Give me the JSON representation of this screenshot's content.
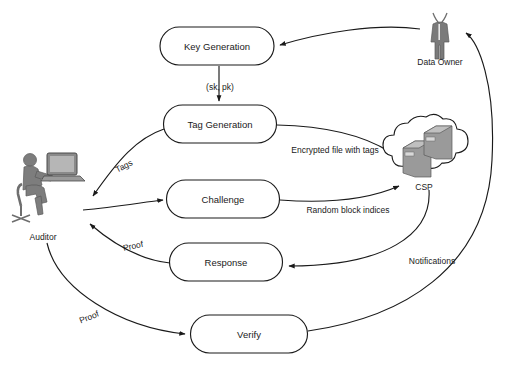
{
  "diagram": {
    "background_color": "#ffffff",
    "stroke_color": "#1a1a1a",
    "actor_fill": "#8c8c8c"
  },
  "nodes": [
    {
      "id": "key-generation",
      "label": "Key Generation",
      "x": 217,
      "y": 46,
      "w": 114,
      "h": 38
    },
    {
      "id": "tag-generation",
      "label": "Tag Generation",
      "x": 220,
      "y": 124,
      "w": 113,
      "h": 38
    },
    {
      "id": "challenge",
      "label": "Challenge",
      "x": 223,
      "y": 199,
      "w": 113,
      "h": 38
    },
    {
      "id": "response",
      "label": "Response",
      "x": 226,
      "y": 262,
      "w": 113,
      "h": 38
    },
    {
      "id": "verify",
      "label": "Verify",
      "x": 249,
      "y": 334,
      "w": 117,
      "h": 38
    }
  ],
  "actors": [
    {
      "id": "data-owner",
      "label": "Data Owner",
      "x": 440,
      "y": 33,
      "label_y": 62
    },
    {
      "id": "auditor",
      "label": "Auditor",
      "x": 43,
      "y": 185,
      "label_y": 237
    },
    {
      "id": "csp",
      "label": "CSP",
      "x": 424,
      "y": 163,
      "label_y": 187
    }
  ],
  "edges": [
    {
      "id": "owner-to-keygen",
      "label": "",
      "from": "data-owner",
      "to": "key-generation"
    },
    {
      "id": "keygen-to-taggen",
      "label": "(sk, pk)",
      "from": "key-generation",
      "to": "tag-generation",
      "label_x": 220,
      "label_y": 87
    },
    {
      "id": "taggen-to-auditor",
      "label": "Tags",
      "from": "tag-generation",
      "to": "auditor",
      "label_x": 124,
      "label_y": 166
    },
    {
      "id": "taggen-to-csp",
      "label": "Encrypted file with tags",
      "from": "tag-generation",
      "to": "csp",
      "label_x": 335,
      "label_y": 150
    },
    {
      "id": "auditor-to-challenge",
      "label": "",
      "from": "auditor",
      "to": "challenge"
    },
    {
      "id": "challenge-to-csp",
      "label": "Random block indices",
      "from": "challenge",
      "to": "csp",
      "label_x": 348,
      "label_y": 210
    },
    {
      "id": "csp-to-response",
      "label": "",
      "from": "csp",
      "to": "response"
    },
    {
      "id": "response-to-auditor",
      "label": "Proof",
      "from": "response",
      "to": "auditor",
      "label_x": 133,
      "label_y": 246
    },
    {
      "id": "auditor-to-verify",
      "label": "Proof",
      "from": "auditor",
      "to": "verify",
      "label_x": 89,
      "label_y": 317
    },
    {
      "id": "verify-to-owner",
      "label": "Notifications",
      "from": "verify",
      "to": "data-owner",
      "label_x": 432,
      "label_y": 261
    }
  ]
}
